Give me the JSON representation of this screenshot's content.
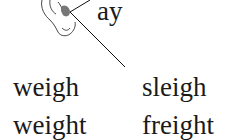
{
  "illustration": {
    "icon": "ear-icon",
    "sound_label": "ay"
  },
  "words": [
    {
      "text": "weigh"
    },
    {
      "text": "sleigh"
    },
    {
      "text": "weight"
    },
    {
      "text": "freight"
    }
  ]
}
